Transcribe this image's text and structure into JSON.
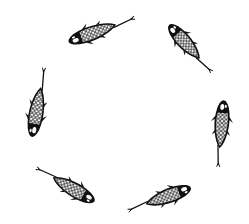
{
  "image": {
    "description": "Ink illustration of six koi fish swimming in a circle on a white background",
    "background": "#ffffff",
    "ink_color": "#111111",
    "fish_count": 6
  },
  "fish": [
    {
      "id": "koi-top-left",
      "cx": 101,
      "cy": 30,
      "angle": 160,
      "length": 68
    },
    {
      "id": "koi-top-right",
      "cx": 190,
      "cy": 48,
      "angle": 50,
      "length": 60
    },
    {
      "id": "koi-left",
      "cx": 38,
      "cy": 103,
      "angle": -100,
      "length": 68
    },
    {
      "id": "koi-right",
      "cx": 221,
      "cy": 133,
      "angle": -95,
      "length": 64
    },
    {
      "id": "koi-bottom-left",
      "cx": 66,
      "cy": 185,
      "angle": 30,
      "length": 64
    },
    {
      "id": "koi-bottom-right",
      "cx": 160,
      "cy": 199,
      "angle": -20,
      "length": 64
    }
  ]
}
